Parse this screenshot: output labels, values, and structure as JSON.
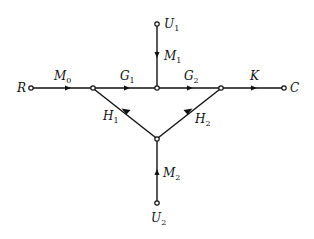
{
  "diagram": {
    "type": "signal-flow-graph",
    "nodes": [
      {
        "id": "R",
        "label": "R",
        "x": 31,
        "y": 88
      },
      {
        "id": "n1",
        "label": "",
        "x": 93,
        "y": 88
      },
      {
        "id": "n2",
        "label": "",
        "x": 157,
        "y": 88
      },
      {
        "id": "n3",
        "label": "",
        "x": 221,
        "y": 88
      },
      {
        "id": "C",
        "label": "C",
        "x": 284,
        "y": 88
      },
      {
        "id": "U1",
        "label": "U",
        "sub": "1",
        "x": 157,
        "y": 24
      },
      {
        "id": "n4",
        "label": "",
        "x": 157,
        "y": 139
      },
      {
        "id": "U2",
        "label": "U",
        "sub": "2",
        "x": 157,
        "y": 203
      }
    ],
    "edges": [
      {
        "from": "R",
        "to": "n1",
        "label": "M",
        "sub": "0"
      },
      {
        "from": "n1",
        "to": "n2",
        "label": "G",
        "sub": "1"
      },
      {
        "from": "n2",
        "to": "n3",
        "label": "G",
        "sub": "2"
      },
      {
        "from": "n3",
        "to": "C",
        "label": "K",
        "sub": ""
      },
      {
        "from": "U1",
        "to": "n2",
        "label": "M",
        "sub": "1"
      },
      {
        "from": "n4",
        "to": "n1",
        "label": "H",
        "sub": "1"
      },
      {
        "from": "n4",
        "to": "n3",
        "label": "H",
        "sub": "2"
      },
      {
        "from": "U2",
        "to": "n4",
        "label": "M",
        "sub": "2"
      }
    ]
  },
  "labels": {
    "R": "R",
    "C": "C",
    "U1": "U",
    "U1_sub": "1",
    "U2": "U",
    "U2_sub": "2",
    "M0": "M",
    "M0_sub": "0",
    "G1": "G",
    "G1_sub": "1",
    "G2": "G",
    "G2_sub": "2",
    "K": "K",
    "M1": "M",
    "M1_sub": "1",
    "H1": "H",
    "H1_sub": "1",
    "H2": "H",
    "H2_sub": "2",
    "M2": "M",
    "M2_sub": "2"
  }
}
